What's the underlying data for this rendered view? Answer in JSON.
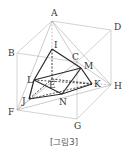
{
  "figure": {
    "caption": "[그림3]",
    "vertices": {
      "A": {
        "label": "A",
        "x": 52,
        "y": 21,
        "lx": 51,
        "ly": 16
      },
      "B": {
        "label": "B",
        "x": 17,
        "y": 53,
        "lx": 8,
        "ly": 56
      },
      "C": {
        "label": "C",
        "x": 77,
        "y": 62,
        "lx": 72,
        "ly": 60
      },
      "D": {
        "label": "D",
        "x": 111,
        "y": 30,
        "lx": 114,
        "ly": 30
      },
      "E": {
        "label": "E",
        "x": 52,
        "y": 79,
        "lx": 49,
        "ly": 88
      },
      "F": {
        "label": "F",
        "x": 17,
        "y": 110,
        "lx": 8,
        "ly": 115
      },
      "G": {
        "label": "G",
        "x": 77,
        "y": 119,
        "lx": 74,
        "ly": 129
      },
      "H": {
        "label": "H",
        "x": 111,
        "y": 85,
        "lx": 114,
        "ly": 89
      },
      "I": {
        "label": "I",
        "x": 52,
        "y": 49,
        "lx": 54,
        "ly": 48
      },
      "J": {
        "label": "J",
        "x": 29,
        "y": 99,
        "lx": 22,
        "ly": 104
      },
      "K": {
        "label": "K",
        "x": 92,
        "y": 84,
        "lx": 94,
        "ly": 87
      },
      "L": {
        "label": "L",
        "x": 34,
        "y": 80,
        "lx": 27,
        "ly": 83
      },
      "M": {
        "label": "M",
        "x": 81,
        "y": 68,
        "lx": 84,
        "ly": 69
      },
      "N": {
        "label": "N",
        "x": 62,
        "y": 94,
        "lx": 59,
        "ly": 105
      }
    },
    "edges": {
      "cube_visible": [
        [
          "A",
          "B"
        ],
        [
          "A",
          "D"
        ],
        [
          "B",
          "C"
        ],
        [
          "C",
          "D"
        ],
        [
          "B",
          "F"
        ],
        [
          "D",
          "H"
        ],
        [
          "C",
          "G"
        ],
        [
          "F",
          "G"
        ],
        [
          "G",
          "H"
        ]
      ],
      "cube_hidden": [
        [
          "A",
          "E"
        ],
        [
          "E",
          "F"
        ],
        [
          "E",
          "H"
        ]
      ],
      "tetrahedron": [
        [
          "A",
          "F"
        ],
        [
          "A",
          "H"
        ],
        [
          "F",
          "H"
        ],
        [
          "C",
          "F"
        ],
        [
          "C",
          "H"
        ],
        [
          "A",
          "C"
        ]
      ],
      "inner_visible": [
        [
          "I",
          "L"
        ],
        [
          "I",
          "M"
        ],
        [
          "L",
          "M"
        ],
        [
          "L",
          "J"
        ],
        [
          "L",
          "N"
        ],
        [
          "J",
          "N"
        ],
        [
          "N",
          "K"
        ],
        [
          "M",
          "K"
        ],
        [
          "M",
          "N"
        ]
      ],
      "inner_hidden": [
        [
          "I",
          "E"
        ],
        [
          "E",
          "J"
        ],
        [
          "E",
          "K"
        ],
        [
          "J",
          "K"
        ],
        [
          "L",
          "K"
        ]
      ]
    }
  }
}
